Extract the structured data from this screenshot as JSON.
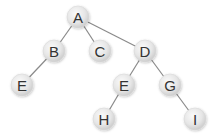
{
  "diagram": {
    "type": "tree",
    "nodes": [
      {
        "id": "A",
        "label": "A",
        "x": 78,
        "y": 17
      },
      {
        "id": "B",
        "label": "B",
        "x": 54,
        "y": 51
      },
      {
        "id": "C",
        "label": "C",
        "x": 100,
        "y": 51
      },
      {
        "id": "D",
        "label": "D",
        "x": 145,
        "y": 51
      },
      {
        "id": "E1",
        "label": "E",
        "x": 22,
        "y": 85
      },
      {
        "id": "E2",
        "label": "E",
        "x": 124,
        "y": 85
      },
      {
        "id": "G",
        "label": "G",
        "x": 170,
        "y": 85
      },
      {
        "id": "H",
        "label": "H",
        "x": 104,
        "y": 119
      },
      {
        "id": "I",
        "label": "I",
        "x": 195,
        "y": 119
      }
    ],
    "edges": [
      {
        "from": "A",
        "to": "B"
      },
      {
        "from": "A",
        "to": "C"
      },
      {
        "from": "A",
        "to": "D"
      },
      {
        "from": "B",
        "to": "E1"
      },
      {
        "from": "D",
        "to": "E2"
      },
      {
        "from": "D",
        "to": "G"
      },
      {
        "from": "E2",
        "to": "H"
      },
      {
        "from": "G",
        "to": "I"
      }
    ],
    "style": {
      "node_radius": 11,
      "node_fill_light": "#f4f4f4",
      "node_fill_dark": "#cfcfcf",
      "edge_color": "#8a8a8a",
      "label_color": "#333333"
    }
  }
}
